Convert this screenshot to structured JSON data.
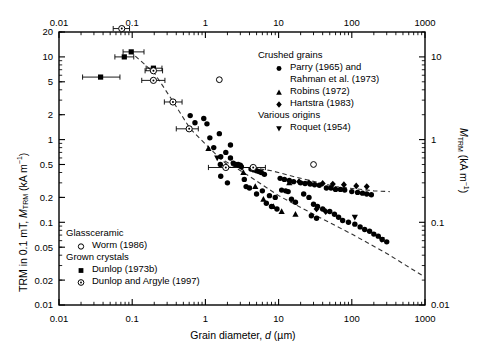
{
  "chart_data": {
    "type": "scatter",
    "title": "",
    "xlabel": "Grain diameter, d (µm)",
    "ylabel_left": "TRM in 0.1 mT, MTRM (kA m−1)",
    "ylabel_right": "MTRM (kA m−1)",
    "xscale": "log",
    "yscale": "log",
    "xlim": [
      0.01,
      1000
    ],
    "ylim_left": [
      0.01,
      20
    ],
    "ylim_right": [
      0.01,
      20
    ],
    "grid": false,
    "xticks": [
      "0.01",
      "0.1",
      "1",
      "10",
      "100",
      "1000"
    ],
    "xtick_values": [
      0.01,
      0.1,
      1,
      10,
      100,
      1000
    ],
    "yticks_left": [
      "20",
      "10",
      "5",
      "2",
      "1",
      "0.5",
      "0.2",
      "0.1",
      "0.05",
      "0.02",
      "0.01"
    ],
    "ytick_values_left": [
      20,
      10,
      5,
      2,
      1,
      0.5,
      0.2,
      0.1,
      0.05,
      0.02,
      0.01
    ],
    "yticks_right": [
      "10",
      "1",
      "0.1",
      "0.01"
    ],
    "ytick_values_right": [
      10,
      1,
      0.1,
      0.01
    ],
    "top_axis_ticks": [
      "0.01",
      "0.1",
      "1",
      "10",
      "100",
      "1000"
    ],
    "series": [
      {
        "name": "Parry (1965) and Rahman et al. (1973)",
        "group": "Crushed grains",
        "marker": "filled-circle",
        "points": [
          [
            1.55,
            1.18
          ],
          [
            1.3,
            0.8
          ],
          [
            1.62,
            0.62
          ],
          [
            1.6,
            0.5
          ],
          [
            1.62,
            0.36
          ],
          [
            1.15,
            1.05
          ],
          [
            1.05,
            1.55
          ],
          [
            0.95,
            1.8
          ],
          [
            2.4,
            0.52
          ],
          [
            2.6,
            0.5
          ],
          [
            2.8,
            0.5
          ],
          [
            3.0,
            0.49
          ],
          [
            3.1,
            0.47
          ],
          [
            2.0,
            0.3
          ],
          [
            2.2,
            0.6
          ],
          [
            4.2,
            0.44
          ],
          [
            4.6,
            0.43
          ],
          [
            5.0,
            0.42
          ],
          [
            5.4,
            0.41
          ],
          [
            5.8,
            0.4
          ],
          [
            6.4,
            0.38
          ],
          [
            4.0,
            0.26
          ],
          [
            5.0,
            0.22
          ],
          [
            6.0,
            0.24
          ],
          [
            7.5,
            0.21
          ],
          [
            9.0,
            0.2
          ],
          [
            10.5,
            0.34
          ],
          [
            12,
            0.33
          ],
          [
            14,
            0.32
          ],
          [
            16,
            0.31
          ],
          [
            11,
            0.245
          ],
          [
            12.5,
            0.24
          ],
          [
            13.5,
            0.235
          ],
          [
            15,
            0.19
          ],
          [
            17,
            0.175
          ],
          [
            20,
            0.3
          ],
          [
            23,
            0.295
          ],
          [
            27,
            0.29
          ],
          [
            31,
            0.285
          ],
          [
            36,
            0.28
          ],
          [
            22,
            0.22
          ],
          [
            26,
            0.2
          ],
          [
            30,
            0.165
          ],
          [
            34,
            0.155
          ],
          [
            40,
            0.145
          ],
          [
            45,
            0.26
          ],
          [
            52,
            0.26
          ],
          [
            60,
            0.25
          ],
          [
            70,
            0.25
          ],
          [
            80,
            0.245
          ],
          [
            50,
            0.135
          ],
          [
            58,
            0.125
          ],
          [
            66,
            0.115
          ],
          [
            75,
            0.105
          ],
          [
            90,
            0.1
          ],
          [
            100,
            0.235
          ],
          [
            120,
            0.23
          ],
          [
            140,
            0.225
          ],
          [
            160,
            0.22
          ],
          [
            185,
            0.215
          ],
          [
            110,
            0.095
          ],
          [
            130,
            0.088
          ],
          [
            150,
            0.082
          ],
          [
            175,
            0.078
          ],
          [
            200,
            0.072
          ],
          [
            230,
            0.068
          ],
          [
            260,
            0.062
          ],
          [
            300,
            0.058
          ],
          [
            28,
            0.12
          ],
          [
            33,
            0.112
          ],
          [
            8.0,
            0.155
          ],
          [
            9.5,
            0.145
          ],
          [
            6.8,
            0.17
          ],
          [
            3.4,
            0.33
          ],
          [
            3.6,
            0.27
          ],
          [
            2.2,
            0.86
          ],
          [
            1.9,
            0.7
          ],
          [
            0.62,
            1.95
          ],
          [
            0.72,
            1.6
          ]
        ]
      },
      {
        "name": "Robins (1972)",
        "group": "Crushed grains",
        "marker": "filled-triangle-up",
        "points": [
          [
            1.1,
            0.78
          ],
          [
            3.3,
            0.4
          ],
          [
            4.8,
            0.27
          ],
          [
            6.2,
            0.19
          ],
          [
            8.5,
            0.155
          ],
          [
            11,
            0.135
          ],
          [
            17,
            0.125
          ],
          [
            14,
            0.3
          ]
        ]
      },
      {
        "name": "Hartstra (1983)",
        "group": "Crushed grains",
        "marker": "filled-diamond",
        "points": [
          [
            19,
            0.31
          ],
          [
            26,
            0.3
          ],
          [
            40,
            0.295
          ],
          [
            55,
            0.29
          ],
          [
            78,
            0.285
          ],
          [
            115,
            0.275
          ],
          [
            160,
            0.27
          ],
          [
            33,
            0.145
          ],
          [
            44,
            0.135
          ]
        ]
      },
      {
        "name": "Roquet (1954)",
        "group": "Various origins",
        "marker": "filled-triangle-down",
        "points": [
          [
            1.45,
            0.6
          ],
          [
            110,
            0.115
          ],
          [
            255,
            0.062
          ]
        ]
      },
      {
        "name": "Worm (1986)",
        "group": "Glassceramic",
        "marker": "open-circle",
        "points": [
          [
            1.55,
            5.3
          ],
          [
            30,
            0.5
          ]
        ]
      },
      {
        "name": "Dunlop (1973b)",
        "group": "Grown crystals",
        "marker": "filled-square",
        "points": [
          [
            0.037,
            5.7
          ],
          [
            0.078,
            10.0
          ],
          [
            0.097,
            11.5
          ],
          [
            0.195,
            7.3
          ]
        ],
        "xerr": [
          [
            0.021,
            0.068
          ],
          [
            0.058,
            0.105
          ],
          [
            0.075,
            0.145
          ],
          [
            0.155,
            0.255
          ]
        ]
      },
      {
        "name": "Dunlop and Argyle (1997)",
        "group": "Grown crystals",
        "marker": "open-circle-dot",
        "points": [
          [
            0.072,
            22.0
          ],
          [
            0.195,
            6.8
          ],
          [
            0.195,
            5.2
          ],
          [
            0.36,
            2.85
          ],
          [
            0.6,
            1.35
          ],
          [
            1.9,
            0.46
          ],
          [
            4.5,
            0.46
          ]
        ],
        "xerr": [
          [
            0.055,
            0.092
          ],
          [
            0.15,
            0.26
          ],
          [
            0.135,
            0.28
          ],
          [
            0.275,
            0.48
          ],
          [
            0.4,
            0.8
          ],
          [
            1.1,
            3.1
          ],
          [
            3.2,
            6.6
          ]
        ]
      }
    ],
    "trend_lines": [
      {
        "name": "grown-crystal-trend",
        "style": "dashed",
        "points": [
          [
            0.092,
            11.8
          ],
          [
            0.2,
            6.4
          ],
          [
            0.36,
            2.9
          ],
          [
            0.62,
            1.35
          ],
          [
            1.5,
            0.62
          ],
          [
            2.2,
            0.46
          ],
          [
            4.2,
            0.46
          ],
          [
            8.0,
            0.42
          ],
          [
            20,
            0.34
          ],
          [
            60,
            0.27
          ],
          [
            200,
            0.24
          ],
          [
            330,
            0.235
          ]
        ]
      },
      {
        "name": "crushed-grain-trend",
        "style": "dashed",
        "points": [
          [
            1.5,
            0.62
          ],
          [
            4,
            0.36
          ],
          [
            10,
            0.21
          ],
          [
            30,
            0.125
          ],
          [
            100,
            0.072
          ],
          [
            300,
            0.042
          ],
          [
            900,
            0.023
          ]
        ]
      }
    ],
    "annotations": []
  },
  "legend": {
    "position": "top-right and bottom-left",
    "top_right": {
      "groups": [
        {
          "heading": "Crushed grains",
          "items": [
            {
              "marker": "filled-circle",
              "label_line1": "Parry (1965) and",
              "label_line2": "Rahman et al. (1973)"
            },
            {
              "marker": "filled-triangle-up",
              "label_line1": "Robins (1972)",
              "label_line2": ""
            },
            {
              "marker": "filled-diamond",
              "label_line1": "Hartstra (1983)",
              "label_line2": ""
            }
          ]
        },
        {
          "heading": "Various origins",
          "items": [
            {
              "marker": "filled-triangle-down",
              "label_line1": "Roquet (1954)",
              "label_line2": ""
            }
          ]
        }
      ]
    },
    "bottom_left": {
      "groups": [
        {
          "heading": "Glassceramic",
          "items": [
            {
              "marker": "open-circle",
              "label_line1": "Worm (1986)",
              "label_line2": ""
            }
          ]
        },
        {
          "heading": "Grown crystals",
          "items": [
            {
              "marker": "filled-square",
              "label_line1": "Dunlop (1973b)",
              "label_line2": ""
            },
            {
              "marker": "open-circle-dot",
              "label_line1": "Dunlop and Argyle (1997)",
              "label_line2": ""
            }
          ]
        }
      ]
    }
  },
  "colors": {
    "axis": "#000000",
    "marker": "#000000",
    "trend": "#555555",
    "background": "#ffffff"
  }
}
